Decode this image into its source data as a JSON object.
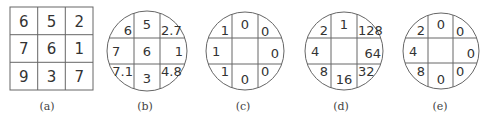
{
  "figure": {
    "panels": [
      {
        "id": "a",
        "caption": "(a)",
        "shape": "square",
        "values": [
          [
            "6",
            "5",
            "2"
          ],
          [
            "7",
            "6",
            "1"
          ],
          [
            "9",
            "3",
            "7"
          ]
        ]
      },
      {
        "id": "b",
        "caption": "(b)",
        "shape": "circle",
        "values": {
          "nw": "6",
          "n": "5",
          "ne": "2.7",
          "w": "7",
          "c": "6",
          "e": "1",
          "sw": "7.1",
          "s": "3",
          "se": "4.8"
        }
      },
      {
        "id": "c",
        "caption": "(c)",
        "shape": "circle",
        "values": {
          "nw": "1",
          "n": "0",
          "ne": "0",
          "w": "1",
          "c": "",
          "e": "0",
          "sw": "1",
          "s": "0",
          "se": "0"
        }
      },
      {
        "id": "d",
        "caption": "(d)",
        "shape": "circle",
        "values": {
          "nw": "2",
          "n": "1",
          "ne": "128",
          "w": "4",
          "c": "",
          "e": "64",
          "sw": "8",
          "s": "16",
          "se": "32"
        }
      },
      {
        "id": "e",
        "caption": "(e)",
        "shape": "circle",
        "values": {
          "nw": "2",
          "n": "0",
          "ne": "0",
          "w": "4",
          "c": "",
          "e": "0",
          "sw": "8",
          "s": "0",
          "se": "0"
        }
      }
    ]
  }
}
